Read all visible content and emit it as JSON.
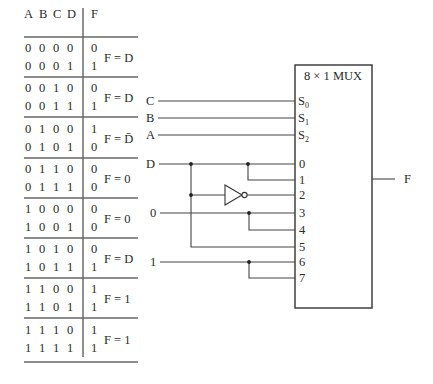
{
  "truth_table": {
    "headers": {
      "inputs": [
        "A",
        "B",
        "C",
        "D"
      ],
      "output": "F"
    },
    "groups": [
      {
        "rows": [
          {
            "inputs": [
              "0",
              "0",
              "0",
              "0"
            ],
            "f": "0"
          },
          {
            "inputs": [
              "0",
              "0",
              "0",
              "1"
            ],
            "f": "1"
          }
        ],
        "expression": "F = D"
      },
      {
        "rows": [
          {
            "inputs": [
              "0",
              "0",
              "1",
              "0"
            ],
            "f": "0"
          },
          {
            "inputs": [
              "0",
              "0",
              "1",
              "1"
            ],
            "f": "1"
          }
        ],
        "expression": "F = D"
      },
      {
        "rows": [
          {
            "inputs": [
              "0",
              "1",
              "0",
              "0"
            ],
            "f": "1"
          },
          {
            "inputs": [
              "0",
              "1",
              "0",
              "1"
            ],
            "f": "0"
          }
        ],
        "expression": "F = D̄"
      },
      {
        "rows": [
          {
            "inputs": [
              "0",
              "1",
              "1",
              "0"
            ],
            "f": "0"
          },
          {
            "inputs": [
              "0",
              "1",
              "1",
              "1"
            ],
            "f": "0"
          }
        ],
        "expression": "F = 0"
      },
      {
        "rows": [
          {
            "inputs": [
              "1",
              "0",
              "0",
              "0"
            ],
            "f": "0"
          },
          {
            "inputs": [
              "1",
              "0",
              "0",
              "1"
            ],
            "f": "0"
          }
        ],
        "expression": "F = 0"
      },
      {
        "rows": [
          {
            "inputs": [
              "1",
              "0",
              "1",
              "0"
            ],
            "f": "0"
          },
          {
            "inputs": [
              "1",
              "0",
              "1",
              "1"
            ],
            "f": "1"
          }
        ],
        "expression": "F = D"
      },
      {
        "rows": [
          {
            "inputs": [
              "1",
              "1",
              "0",
              "0"
            ],
            "f": "1"
          },
          {
            "inputs": [
              "1",
              "1",
              "0",
              "1"
            ],
            "f": "1"
          }
        ],
        "expression": "F = 1"
      },
      {
        "rows": [
          {
            "inputs": [
              "1",
              "1",
              "1",
              "0"
            ],
            "f": "1"
          },
          {
            "inputs": [
              "1",
              "1",
              "1",
              "1"
            ],
            "f": "1"
          }
        ],
        "expression": "F = 1"
      }
    ]
  },
  "mux": {
    "title": "8 × 1 MUX",
    "select_lines": [
      {
        "signal": "C",
        "pin": "S",
        "sub": "0"
      },
      {
        "signal": "B",
        "pin": "S",
        "sub": "1"
      },
      {
        "signal": "A",
        "pin": "S",
        "sub": "2"
      }
    ],
    "data_inputs": [
      "0",
      "1",
      "2",
      "3",
      "4",
      "5",
      "6",
      "7"
    ],
    "input_sources": {
      "d_label": "D",
      "zero_label": "0",
      "one_label": "1"
    },
    "output_label": "F"
  }
}
